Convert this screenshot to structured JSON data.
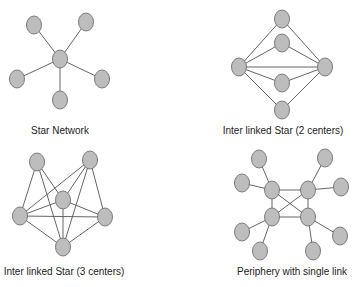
{
  "diagrams": [
    {
      "id": "star",
      "title": "Star Network",
      "label_pos": {
        "x": 60,
        "y": 125
      },
      "nodes": [
        {
          "x": 34,
          "y": 25
        },
        {
          "x": 86,
          "y": 22
        },
        {
          "x": 60,
          "y": 59
        },
        {
          "x": 17,
          "y": 79
        },
        {
          "x": 102,
          "y": 79
        },
        {
          "x": 60,
          "y": 100
        }
      ],
      "edges": [
        [
          2,
          0
        ],
        [
          2,
          1
        ],
        [
          2,
          3
        ],
        [
          2,
          4
        ],
        [
          2,
          5
        ]
      ]
    },
    {
      "id": "star2",
      "title": "Inter linked Star (2 centers)",
      "label_pos": {
        "x": 283,
        "y": 125
      },
      "nodes": [
        {
          "x": 239,
          "y": 67
        },
        {
          "x": 325,
          "y": 67
        },
        {
          "x": 282,
          "y": 19
        },
        {
          "x": 282,
          "y": 43
        },
        {
          "x": 282,
          "y": 83
        },
        {
          "x": 282,
          "y": 110
        }
      ],
      "edges": [
        [
          0,
          1
        ],
        [
          0,
          2
        ],
        [
          0,
          3
        ],
        [
          0,
          4
        ],
        [
          0,
          5
        ],
        [
          1,
          2
        ],
        [
          1,
          3
        ],
        [
          1,
          4
        ],
        [
          1,
          5
        ]
      ]
    },
    {
      "id": "star3",
      "title": "Inter linked Star (3 centers)",
      "label_pos": {
        "x": 64,
        "y": 266
      },
      "nodes": [
        {
          "x": 37,
          "y": 162
        },
        {
          "x": 90,
          "y": 160
        },
        {
          "x": 63,
          "y": 200
        },
        {
          "x": 20,
          "y": 216
        },
        {
          "x": 105,
          "y": 217
        },
        {
          "x": 63,
          "y": 247
        }
      ],
      "edges": [
        [
          0,
          3
        ],
        [
          0,
          2
        ],
        [
          0,
          5
        ],
        [
          1,
          3
        ],
        [
          1,
          2
        ],
        [
          1,
          5
        ],
        [
          1,
          4
        ],
        [
          2,
          3
        ],
        [
          2,
          4
        ],
        [
          2,
          5
        ],
        [
          3,
          4
        ],
        [
          3,
          5
        ],
        [
          4,
          5
        ]
      ]
    },
    {
      "id": "periphery",
      "title": "Periphery with single link",
      "label_pos": {
        "x": 292,
        "y": 266
      },
      "nodes": [
        {
          "x": 272,
          "y": 190
        },
        {
          "x": 308,
          "y": 190
        },
        {
          "x": 272,
          "y": 217
        },
        {
          "x": 308,
          "y": 217
        },
        {
          "x": 259,
          "y": 159
        },
        {
          "x": 242,
          "y": 183
        },
        {
          "x": 325,
          "y": 158
        },
        {
          "x": 341,
          "y": 187
        },
        {
          "x": 242,
          "y": 232
        },
        {
          "x": 260,
          "y": 251
        },
        {
          "x": 340,
          "y": 236
        },
        {
          "x": 313,
          "y": 251
        }
      ],
      "edges": [
        [
          0,
          1
        ],
        [
          0,
          2
        ],
        [
          1,
          3
        ],
        [
          2,
          3
        ],
        [
          0,
          3
        ],
        [
          1,
          2
        ],
        [
          0,
          4
        ],
        [
          0,
          5
        ],
        [
          1,
          6
        ],
        [
          1,
          7
        ],
        [
          2,
          8
        ],
        [
          2,
          9
        ],
        [
          3,
          10
        ],
        [
          3,
          11
        ]
      ]
    }
  ],
  "style": {
    "node_fill": "#bdbdbd",
    "node_stroke": "#6f6f6f",
    "edge_color": "#555555"
  }
}
